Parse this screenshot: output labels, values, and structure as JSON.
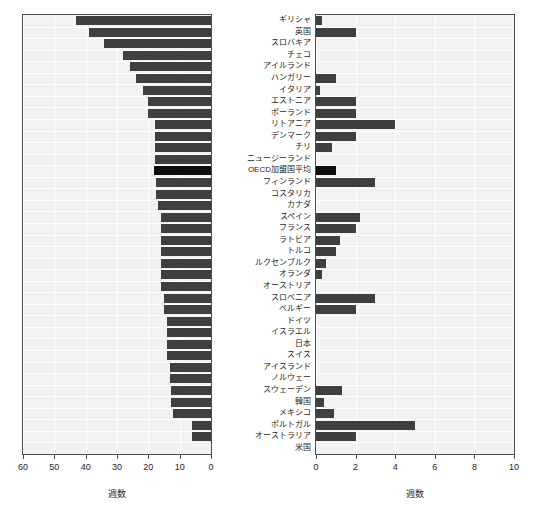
{
  "chart_data": [
    {
      "type": "bar",
      "id": "left-panel",
      "orientation": "horizontal",
      "title": "",
      "xlabel": "週数",
      "ylabel": "",
      "xlim": [
        60,
        0
      ],
      "xticks": [
        60,
        50,
        40,
        30,
        20,
        10,
        0
      ],
      "reversed_axis": true,
      "grid": true,
      "categories": [
        "ギリシャ",
        "英国",
        "スロバキア",
        "チェコ",
        "アイルランド",
        "ハンガリー",
        "イタリア",
        "エストニア",
        "ポーランド",
        "リトアニア",
        "デンマーク",
        "チリ",
        "ニュージーランド",
        "OECD加盟国平均",
        "フィンランド",
        "コスタリカ",
        "カナダ",
        "スペイン",
        "フランス",
        "ラトビア",
        "トルコ",
        "ルクセンブルク",
        "オランダ",
        "オーストリア",
        "スロベニア",
        "ベルギー",
        "ドイツ",
        "イスラエル",
        "日本",
        "スイス",
        "アイスランド",
        "ノルウェー",
        "スウェーデン",
        "韓国",
        "メキシコ",
        "ポルトガル",
        "オーストラリア",
        "米国"
      ],
      "values": [
        43.0,
        39.0,
        34.0,
        28.0,
        26.0,
        24.0,
        21.8,
        20.0,
        20.0,
        18.0,
        18.0,
        18.0,
        18.0,
        18.2,
        17.5,
        17.5,
        17.0,
        16.0,
        16.0,
        16.0,
        16.0,
        16.0,
        16.0,
        16.0,
        15.0,
        15.0,
        14.0,
        14.0,
        14.0,
        14.0,
        13.0,
        13.0,
        12.8,
        12.8,
        12.0,
        6.0,
        6.0,
        0.0
      ],
      "highlight_index": 13,
      "highlight_color": "#0d0d0d",
      "bar_color": "#3f3f3f"
    },
    {
      "type": "bar",
      "id": "right-panel",
      "orientation": "horizontal",
      "title": "",
      "xlabel": "週数",
      "ylabel": "",
      "xlim": [
        0,
        10
      ],
      "xticks": [
        0,
        2,
        4,
        6,
        8,
        10
      ],
      "grid": true,
      "categories": [
        "ギリシャ",
        "英国",
        "スロバキア",
        "チェコ",
        "アイルランド",
        "ハンガリー",
        "イタリア",
        "エストニア",
        "ポーランド",
        "リトアニア",
        "デンマーク",
        "チリ",
        "ニュージーランド",
        "OECD加盟国平均",
        "フィンランド",
        "コスタリカ",
        "カナダ",
        "スペイン",
        "フランス",
        "ラトビア",
        "トルコ",
        "ルクセンブルク",
        "オランダ",
        "オーストリア",
        "スロベニア",
        "ベルギー",
        "ドイツ",
        "イスラエル",
        "日本",
        "スイス",
        "アイスランド",
        "ノルウェー",
        "スウェーデン",
        "韓国",
        "メキシコ",
        "ポルトガル",
        "オーストラリア",
        "米国"
      ],
      "values": [
        0.3,
        2.0,
        0.0,
        0.0,
        0.0,
        1.0,
        0.2,
        2.0,
        2.0,
        4.0,
        2.0,
        0.8,
        0.0,
        1.0,
        3.0,
        0.0,
        0.0,
        2.2,
        2.0,
        1.2,
        1.0,
        0.5,
        0.3,
        0.0,
        3.0,
        2.0,
        0.0,
        0.0,
        0.0,
        0.0,
        0.0,
        0.0,
        1.3,
        0.4,
        0.9,
        5.0,
        2.0,
        0.0
      ],
      "highlight_index": 13,
      "highlight_color": "#0d0d0d",
      "bar_color": "#3f3f3f"
    }
  ],
  "axes": {
    "left": {
      "tick_labels": [
        "60",
        "50",
        "40",
        "30",
        "20",
        "10",
        "0"
      ],
      "title": "週数"
    },
    "right": {
      "tick_labels": [
        "0",
        "2",
        "4",
        "6",
        "8",
        "10"
      ],
      "title": "週数"
    }
  }
}
